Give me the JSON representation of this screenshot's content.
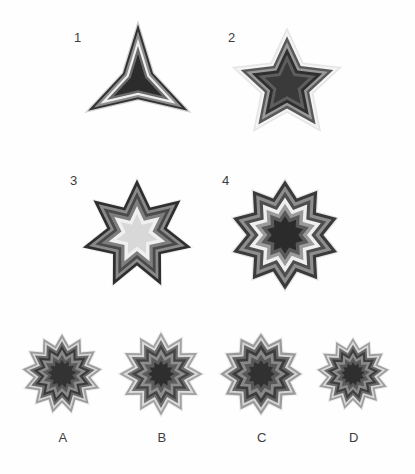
{
  "page": {
    "background_color": "#fefefe",
    "width": 415,
    "height": 474
  },
  "palette": {
    "layer_colors": [
      "#d9d9d9",
      "#f0f0f0",
      "#4a4a4a",
      "#8c8c8c",
      "#3a3a3a",
      "#6e6e6e",
      "#2e2e2e",
      "#e8e8e8",
      "#5a5a5a",
      "#333333"
    ],
    "label_color": "#3c3c3c",
    "outline_dark": "#2b2b2b",
    "mid_gray": "#707070",
    "light_gray": "#dcdcdc",
    "very_light": "#f2f2f2"
  },
  "sequence": {
    "label": "Sequence row",
    "items": [
      {
        "id": "figure-1",
        "number": "1",
        "points": 3,
        "inner_ratio": 0.3,
        "rotation": -90,
        "cx": 138,
        "cy": 82,
        "outer_radius": 62,
        "layers": [
          {
            "scale": 1.0,
            "color": "#d0d0d0"
          },
          {
            "scale": 0.93,
            "color": "#333333"
          },
          {
            "scale": 0.82,
            "color": "#8e8e8e"
          },
          {
            "scale": 0.7,
            "color": "#efefef"
          },
          {
            "scale": 0.58,
            "color": "#6a6a6a"
          },
          {
            "scale": 0.45,
            "color": "#2c2c2c"
          }
        ]
      },
      {
        "id": "figure-2",
        "number": "2",
        "points": 5,
        "inner_ratio": 0.48,
        "rotation": -90,
        "cx": 287,
        "cy": 85,
        "outer_radius": 58,
        "layers": [
          {
            "scale": 1.0,
            "color": "#e6e6e6"
          },
          {
            "scale": 0.93,
            "color": "#f4f4f4"
          },
          {
            "scale": 0.84,
            "color": "#585858"
          },
          {
            "scale": 0.74,
            "color": "#9a9a9a"
          },
          {
            "scale": 0.64,
            "color": "#2f2f2f"
          },
          {
            "scale": 0.52,
            "color": "#5e5e5e"
          },
          {
            "scale": 0.4,
            "color": "#3a3a3a"
          }
        ]
      },
      {
        "id": "figure-3",
        "number": "3",
        "points": 7,
        "inner_ratio": 0.55,
        "rotation": -90,
        "cx": 137,
        "cy": 235,
        "outer_radius": 58,
        "layers": [
          {
            "scale": 1.0,
            "color": "#efefef"
          },
          {
            "scale": 0.96,
            "color": "#2f2f2f"
          },
          {
            "scale": 0.85,
            "color": "#8a8a8a"
          },
          {
            "scale": 0.74,
            "color": "#4a4a4a"
          },
          {
            "scale": 0.63,
            "color": "#7e7e7e"
          },
          {
            "scale": 0.5,
            "color": "#f0f0f0"
          },
          {
            "scale": 0.36,
            "color": "#d8d8d8"
          }
        ]
      },
      {
        "id": "figure-4",
        "number": "4",
        "points": 10,
        "inner_ratio": 0.7,
        "rotation": -90,
        "cx": 285,
        "cy": 235,
        "outer_radius": 57,
        "layers": [
          {
            "scale": 1.0,
            "color": "#e4e4e4"
          },
          {
            "scale": 0.96,
            "color": "#3a3a3a"
          },
          {
            "scale": 0.86,
            "color": "#8e8e8e"
          },
          {
            "scale": 0.76,
            "color": "#4e4e4e"
          },
          {
            "scale": 0.66,
            "color": "#efefef"
          },
          {
            "scale": 0.55,
            "color": "#9a9a9a"
          },
          {
            "scale": 0.44,
            "color": "#5a5a5a"
          },
          {
            "scale": 0.33,
            "color": "#2b2b2b"
          }
        ]
      }
    ]
  },
  "options": {
    "label": "Answer options row",
    "items": [
      {
        "id": "option-a",
        "letter": "A",
        "points": 13,
        "inner_ratio": 0.72,
        "rotation": -90,
        "cx": 62,
        "cy": 374,
        "outer_radius": 42,
        "layers": [
          {
            "scale": 1.0,
            "color": "#ededed"
          },
          {
            "scale": 0.95,
            "color": "#9c9c9c"
          },
          {
            "scale": 0.86,
            "color": "#d6d6d6"
          },
          {
            "scale": 0.78,
            "color": "#6a6a6a"
          },
          {
            "scale": 0.68,
            "color": "#3a3a3a"
          },
          {
            "scale": 0.58,
            "color": "#8a8a8a"
          },
          {
            "scale": 0.46,
            "color": "#5a5a5a"
          },
          {
            "scale": 0.34,
            "color": "#333333"
          }
        ]
      },
      {
        "id": "option-b",
        "letter": "B",
        "points": 12,
        "inner_ratio": 0.7,
        "rotation": -90,
        "cx": 161,
        "cy": 374,
        "outer_radius": 44,
        "layers": [
          {
            "scale": 1.0,
            "color": "#efefef"
          },
          {
            "scale": 0.95,
            "color": "#a2a2a2"
          },
          {
            "scale": 0.86,
            "color": "#dcdcdc"
          },
          {
            "scale": 0.77,
            "color": "#6e6e6e"
          },
          {
            "scale": 0.67,
            "color": "#444444"
          },
          {
            "scale": 0.56,
            "color": "#8e8e8e"
          },
          {
            "scale": 0.44,
            "color": "#5c5c5c"
          },
          {
            "scale": 0.3,
            "color": "#2e2e2e"
          }
        ]
      },
      {
        "id": "option-c",
        "letter": "C",
        "points": 12,
        "inner_ratio": 0.74,
        "rotation": -90,
        "cx": 261,
        "cy": 374,
        "outer_radius": 43,
        "layers": [
          {
            "scale": 1.0,
            "color": "#efefef"
          },
          {
            "scale": 0.95,
            "color": "#9a9a9a"
          },
          {
            "scale": 0.86,
            "color": "#d4d4d4"
          },
          {
            "scale": 0.78,
            "color": "#666666"
          },
          {
            "scale": 0.68,
            "color": "#3c3c3c"
          },
          {
            "scale": 0.57,
            "color": "#888888"
          },
          {
            "scale": 0.45,
            "color": "#585858"
          },
          {
            "scale": 0.32,
            "color": "#313131"
          }
        ]
      },
      {
        "id": "option-d",
        "letter": "D",
        "points": 13,
        "inner_ratio": 0.73,
        "rotation": -90,
        "cx": 353,
        "cy": 374,
        "outer_radius": 38,
        "layers": [
          {
            "scale": 1.0,
            "color": "#ededed"
          },
          {
            "scale": 0.95,
            "color": "#9e9e9e"
          },
          {
            "scale": 0.86,
            "color": "#d8d8d8"
          },
          {
            "scale": 0.77,
            "color": "#6a6a6a"
          },
          {
            "scale": 0.67,
            "color": "#3e3e3e"
          },
          {
            "scale": 0.56,
            "color": "#8c8c8c"
          },
          {
            "scale": 0.44,
            "color": "#5a5a5a"
          },
          {
            "scale": 0.31,
            "color": "#2f2f2f"
          }
        ]
      }
    ]
  },
  "number_labels": [
    {
      "text": "1",
      "x": 74,
      "y": 30
    },
    {
      "text": "2",
      "x": 228,
      "y": 30
    },
    {
      "text": "3",
      "x": 70,
      "y": 173
    },
    {
      "text": "4",
      "x": 222,
      "y": 173
    }
  ],
  "option_labels": [
    {
      "text": "A",
      "x": 56,
      "y": 430
    },
    {
      "text": "B",
      "x": 155,
      "y": 430
    },
    {
      "text": "C",
      "x": 255,
      "y": 430
    },
    {
      "text": "D",
      "x": 347,
      "y": 430
    }
  ]
}
